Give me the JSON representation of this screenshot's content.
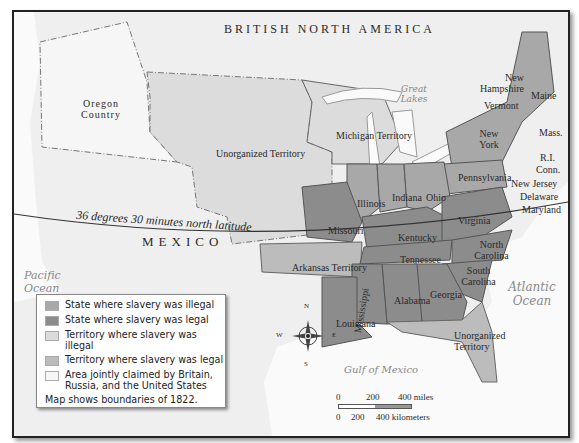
{
  "map": {
    "regions": {
      "british_north_america": "BRITISH NORTH AMERICA",
      "mexico": "MEXICO",
      "oregon_country": "Oregon Country",
      "unorganized_territory": "Unorganized Territory",
      "michigan_territory": "Michigan Territory",
      "arkansas_territory": "Arkansas Territory",
      "unorganized_territory_fl": "Unorganized Territory"
    },
    "water": {
      "great_lakes": "Great Lakes",
      "pacific_ocean": "Pacific Ocean",
      "atlantic_ocean": "Atlantic Ocean",
      "gulf_of_mexico": "Gulf of Mexico"
    },
    "states": {
      "new_hampshire": "New Hampshire",
      "vermont": "Vermont",
      "maine": "Maine",
      "mass": "Mass.",
      "new_york": "New York",
      "ri": "R.I.",
      "conn": "Conn.",
      "pennsylvania": "Pennsylvania",
      "new_jersey": "New Jersey",
      "delaware": "Delaware",
      "maryland": "Maryland",
      "illinois": "Illinois",
      "indiana": "Indiana",
      "ohio": "Ohio",
      "missouri": "Missouri",
      "kentucky": "Kentucky",
      "virginia": "Virginia",
      "tennessee": "Tennessee",
      "north_carolina": "North Carolina",
      "south_carolina": "South Carolina",
      "georgia": "Georgia",
      "alabama": "Alabama",
      "mississippi": "Mississippi",
      "louisiana": "Louisiana"
    },
    "latitude_line": "36 degrees 30 minutes north latitude",
    "compass": {
      "n": "N",
      "s": "S",
      "e": "E",
      "w": "W"
    },
    "scale": {
      "miles": [
        "0",
        "200",
        "400 miles"
      ],
      "km": [
        "0",
        "200",
        "400 kilometers"
      ]
    }
  },
  "legend": {
    "items": [
      {
        "label": "State where slavery was illegal",
        "color": "#a8a8a8"
      },
      {
        "label": "State where slavery was legal",
        "color": "#8c8c8c"
      },
      {
        "label": "Territory where slavery was illegal",
        "color": "#dcdcdc"
      },
      {
        "label": "Territory where slavery was legal",
        "color": "#bcbcbc"
      },
      {
        "label": "Area jointly claimed by Britain, Russia, and the United States",
        "color": "#f6f6f6"
      }
    ],
    "note": "Map shows boundaries of 1822."
  },
  "colors": {
    "free_state": "#a8a8a8",
    "slave_state": "#8c8c8c",
    "free_territory": "#dcdcdc",
    "slave_territory": "#bcbcbc",
    "joint_area": "#f6f6f6",
    "water": "#ffffff",
    "foreign": "#efefef"
  }
}
